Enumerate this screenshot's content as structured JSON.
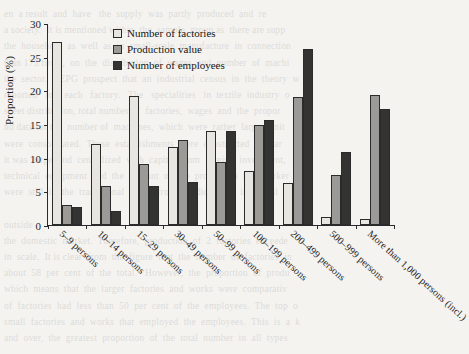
{
  "chart_data": {
    "type": "bar",
    "title": "",
    "xlabel": "",
    "ylabel": "Proportion (%)",
    "ylim": [
      0,
      30
    ],
    "yticks": [
      0,
      5,
      10,
      15,
      20,
      25,
      30
    ],
    "grid": false,
    "legend_position": "top-center",
    "categories": [
      "5–9 persons",
      "10–14 persons",
      "15–29 persons",
      "30–49 persons",
      "50–99 persons",
      "100–199 persons",
      "200–499 persons",
      "500–999 persons",
      "More than 1,000 persons (incl.)"
    ],
    "series": [
      {
        "name": "Number of factories",
        "color": "#e8e6e1",
        "values": [
          27.2,
          12.1,
          19.2,
          11.6,
          14.0,
          8.0,
          6.3,
          1.2,
          0.9
        ]
      },
      {
        "name": "Production value",
        "color": "#9b9a96",
        "values": [
          3.0,
          5.8,
          9.0,
          12.6,
          9.4,
          14.8,
          19.0,
          7.5,
          19.3
        ]
      },
      {
        "name": "Number of employees",
        "color": "#333331",
        "values": [
          2.7,
          2.1,
          5.8,
          6.4,
          14.0,
          15.6,
          26.2,
          10.9,
          17.2
        ]
      }
    ]
  },
  "legend": {
    "items": [
      {
        "label": "Number of factories",
        "swatch": "light-swatch-icon"
      },
      {
        "label": "Production value",
        "swatch": "medium-swatch-icon"
      },
      {
        "label": "Number of employees",
        "swatch": "dark-swatch-icon"
      }
    ]
  },
  "background_text": "en  a result  and  have   the  supply  was  partly  produced  and  re\na society.  It is mentioned within  the  sample  group as  there are supp\nthe  household  as  well  as  in  small-scale  manufacture  in  connection\nthan 173 firms,  on  the  distribution  of  wages  and  number  of  machi\nthe  sector.  UEPG  prospect  that  an  industrial  census  in  the  theory  w\nreported   for   each   factory.   The   specialities   in  textile  industry  o\nsheet distribution, total number of  factories,  wages  and  the  propor\nno data for the  number of  machines,  which  were  rather  larger  unit\nwere  consolidated.  These  establishments  were  constructed  for  lar\nit was  large  and  centralized  with  capital  from  foreign  investment,\ntechnical  equipment  and  the  amount  of  the  production  per  worker\nwere  still  in  the  transitional  phase  from  handicraft  to  industrial  w\n\noutside\nthe  domestic  market.  Therefore,  production  of  2  factories  exceede\nin  scale.  It is clear  from  the  figure  that  the  number  of  factories  in\nabout  58  per  cent  of  the  total.   However,  the  proportion  of  produ\nwhich  means  that  the  larger  factories  and  works  were  comparativ\nof  factories  had  less  than  50  per  cent  of  the  employees.  The  top  o\nsmall  factories  and  works  that  employed  the  employees.  This  is  a  k\nand  over,  the  greatest  proportion  of  the  total  number  in  all  types"
}
